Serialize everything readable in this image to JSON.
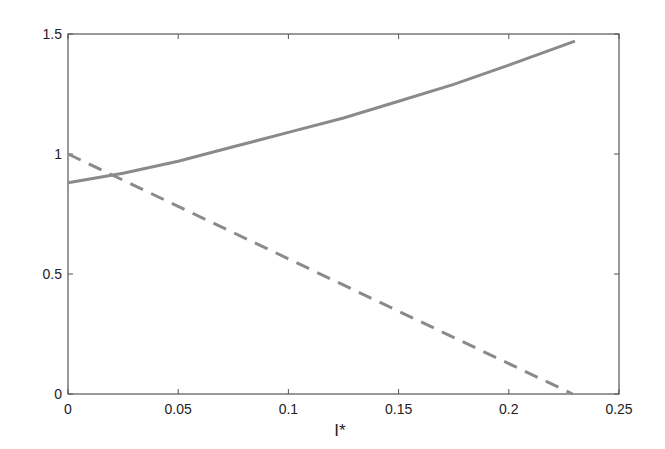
{
  "chart_data": {
    "type": "line",
    "title": "",
    "xlabel": "I*",
    "ylabel": "",
    "xlim": [
      0,
      0.25
    ],
    "ylim": [
      0,
      1.5
    ],
    "xticks": [
      "0",
      "0.05",
      "0.1",
      "0.15",
      "0.2",
      "0.25"
    ],
    "yticks": [
      "0",
      "0.5",
      "1",
      "1.5"
    ],
    "grid": false,
    "legend": null,
    "series": [
      {
        "name": "solid",
        "style": "solid",
        "color": "#8a8a8a",
        "x": [
          0,
          0.025,
          0.05,
          0.075,
          0.1,
          0.125,
          0.15,
          0.175,
          0.2,
          0.23
        ],
        "y": [
          0.88,
          0.92,
          0.97,
          1.03,
          1.09,
          1.15,
          1.22,
          1.29,
          1.37,
          1.47
        ]
      },
      {
        "name": "dashed",
        "style": "dashed",
        "color": "#8a8a8a",
        "x": [
          0,
          0.229
        ],
        "y": [
          1.0,
          0.0
        ]
      }
    ]
  }
}
